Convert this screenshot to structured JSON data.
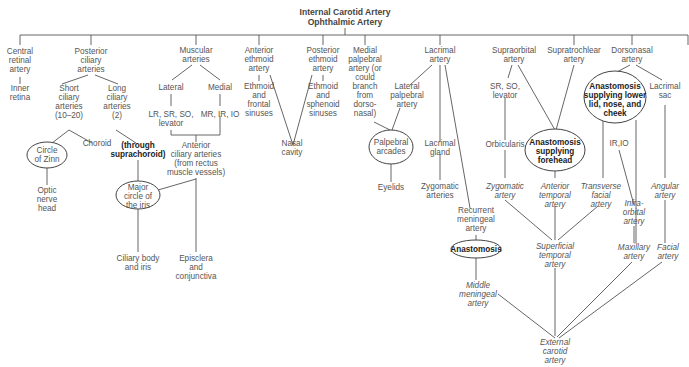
{
  "title": {
    "line1": "Internal Carotid Artery",
    "line2": "Ophthalmic Artery"
  },
  "branches": {
    "central_retinal": [
      "Central",
      "retinal",
      "artery"
    ],
    "inner_retina": [
      "Inner",
      "retina"
    ],
    "posterior_ciliary": [
      "Posterior",
      "ciliary",
      "arteries"
    ],
    "short_ciliary": [
      "Short",
      "ciliary",
      "arteries",
      "(10–20)"
    ],
    "long_ciliary": [
      "Long",
      "ciliary",
      "arteries",
      "(2)"
    ],
    "circle_of_zinn": [
      "Circle",
      "of Zinn"
    ],
    "choroid": "Choroid",
    "optic_nerve_head": [
      "Optic",
      "nerve",
      "head"
    ],
    "through_suprachoroid": [
      "(through",
      "suprachoroid)"
    ],
    "major_circle": [
      "Major",
      "circle of",
      "the iris"
    ],
    "ciliary_body": [
      "Ciliary body",
      "and iris"
    ],
    "muscular": [
      "Muscular",
      "arteries"
    ],
    "lateral": "Lateral",
    "medial": "Medial",
    "lateral_muscles": [
      "LR, SR, SO,",
      "levator"
    ],
    "medial_muscles": "MR, IR, IO",
    "anterior_ciliary": [
      "Anterior",
      "ciliary arteries",
      "(from rectus",
      "muscle vessels)"
    ],
    "episclera": [
      "Episclera",
      "and",
      "conjunctiva"
    ],
    "anterior_ethmoid": [
      "Anterior",
      "ethmoid",
      "artery"
    ],
    "ethmoid_frontal": [
      "Ethmoid",
      "and",
      "frontal",
      "sinuses"
    ],
    "posterior_ethmoid": [
      "Posterior",
      "ethmoid",
      "artery"
    ],
    "ethmoid_sphenoid": [
      "Ethmoid",
      "and",
      "sphenoid",
      "sinuses"
    ],
    "nasal_cavity": [
      "Nasal",
      "cavity"
    ],
    "medial_palpebral": [
      "Medial",
      "palpebral",
      "artery (or",
      "could",
      "branch",
      "from",
      "dorso-",
      "nasal)"
    ],
    "lacrimal": [
      "Lacrimal",
      "artery"
    ],
    "lateral_palpebral": [
      "Lateral",
      "palpebral",
      "artery"
    ],
    "palpebral_arcades": [
      "Palpebral",
      "arcades"
    ],
    "eyelids": "Eyelids",
    "lacrimal_gland": [
      "Lacrimal",
      "gland"
    ],
    "zygomatic_arteries": [
      "Zygomatic",
      "arteries"
    ],
    "recurrent_meningeal": [
      "Recurrent",
      "meningeal",
      "artery"
    ],
    "anastomosis": "Anastomosis",
    "middle_meningeal": [
      "Middle",
      "meningeal",
      "artery"
    ],
    "supraorbital": [
      "Supraorbital",
      "artery"
    ],
    "supraorbital_muscles": [
      "SR, SO,",
      "levator"
    ],
    "orbicularis": "Orbicularis",
    "zygomatic_artery": [
      "Zygomatic",
      "artery"
    ],
    "supratrochlear": [
      "Supratrochlear",
      "artery"
    ],
    "anastomosis_forehead": [
      "Anastomosis",
      "supplying",
      "forehead"
    ],
    "anterior_temporal": [
      "Anterior",
      "temporal",
      "artery"
    ],
    "superficial_temporal": [
      "Superficial",
      "temporal",
      "artery"
    ],
    "dorsonasal": [
      "Dorsonasal",
      "artery"
    ],
    "anastomosis_lower_lid": [
      "Anastomosis",
      "supplying lower",
      "lid, nose, and",
      "cheek"
    ],
    "lacrimal_sac": [
      "Lacrimal",
      "sac"
    ],
    "ir_io": "IR,IO",
    "transverse_facial": [
      "Transverse",
      "facial",
      "artery"
    ],
    "infraorbital": [
      "Infra-",
      "orbital",
      "artery"
    ],
    "angular": [
      "Angular",
      "artery"
    ],
    "maxillary": [
      "Maxillary",
      "artery"
    ],
    "facial": [
      "Facial",
      "artery"
    ],
    "external_carotid": [
      "External",
      "carotid",
      "artery"
    ]
  }
}
